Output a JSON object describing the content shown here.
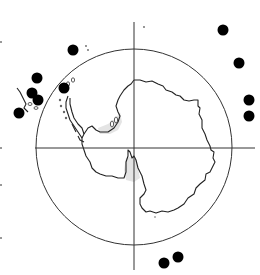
{
  "map": {
    "projection": "south-polar-stereographic",
    "subject": "Antarctica",
    "colors": {
      "background": "#ffffff",
      "coastline": "#222222",
      "grid": "#333333",
      "ice_shelf_shading": "#e4e4e4",
      "markers": "#000000"
    },
    "reference_circle": {
      "cx": 134,
      "cy": 147,
      "r": 98
    },
    "crosshair": {
      "horizontal": {
        "y": 148,
        "x1": 35,
        "x2": 255
      },
      "vertical": {
        "x": 134,
        "y1": 22,
        "y2": 270
      }
    },
    "markers": [
      {
        "id": "m1",
        "x": 73,
        "y": 50,
        "r": 5.5
      },
      {
        "id": "m2",
        "x": 37,
        "y": 78,
        "r": 5.5
      },
      {
        "id": "m3",
        "x": 32,
        "y": 93,
        "r": 5.5
      },
      {
        "id": "m4",
        "x": 38,
        "y": 100,
        "r": 5.5
      },
      {
        "id": "m5",
        "x": 19,
        "y": 113,
        "r": 5.5
      },
      {
        "id": "m6",
        "x": 64,
        "y": 88,
        "r": 5.5
      },
      {
        "id": "m7",
        "x": 223,
        "y": 30,
        "r": 5.5
      },
      {
        "id": "m8",
        "x": 239,
        "y": 63,
        "r": 5.5
      },
      {
        "id": "m9",
        "x": 249,
        "y": 100,
        "r": 5.5
      },
      {
        "id": "m10",
        "x": 249,
        "y": 116,
        "r": 5.5
      },
      {
        "id": "m11",
        "x": 164,
        "y": 263,
        "r": 5.5
      },
      {
        "id": "m12",
        "x": 178,
        "y": 257,
        "r": 5.5
      }
    ]
  }
}
